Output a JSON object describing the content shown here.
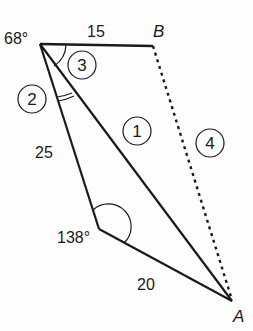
{
  "diagram": {
    "vertices": {
      "top_left": {
        "angle_label": "68°"
      },
      "B": {
        "label": "B"
      },
      "A": {
        "label": "A"
      },
      "bottom_left": {
        "angle_label": "138°"
      }
    },
    "sides": {
      "top": "15",
      "left": "25",
      "bottom": "20"
    },
    "region_markers": [
      "1",
      "2",
      "3",
      "4"
    ],
    "colors": {
      "line": "#1a1a1a",
      "background": "#fdfdfd"
    }
  }
}
